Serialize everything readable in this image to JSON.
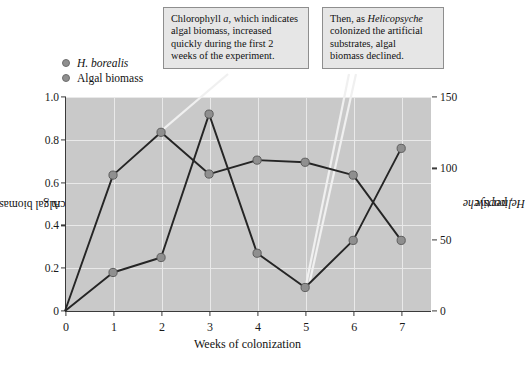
{
  "chart_data": {
    "type": "line",
    "title": "",
    "xlabel": "Weeks of colonization",
    "ylabel_left": "Algal biomass, as chlorophyll a (µg/cm2)",
    "ylabel_right": "Helicopsyche, per tile",
    "x": [
      0,
      1,
      2,
      3,
      4,
      5,
      6,
      7
    ],
    "xlim": [
      0,
      7.6
    ],
    "xticks": [
      "0",
      "1",
      "2",
      "3",
      "4",
      "5",
      "6",
      "7"
    ],
    "left_axis": {
      "ticks": [
        "0",
        "0.2",
        "0.4",
        "0.6",
        "0.8",
        "1.0"
      ],
      "tickvalues": [
        0,
        0.2,
        0.4,
        0.6,
        0.8,
        1.0
      ],
      "ylim": [
        0,
        1.0
      ]
    },
    "right_axis": {
      "ticks": [
        "0",
        "50",
        "100",
        "150"
      ],
      "tickvalues": [
        0,
        50,
        100,
        150
      ],
      "ylim": [
        0,
        150
      ]
    },
    "grid": true,
    "legend_position": "above-plot-left",
    "series": [
      {
        "name": "H. borealis",
        "axis": "right",
        "unit": "per tile",
        "color": "#8f8f8f",
        "values": [
          0,
          27,
          38,
          139,
          40,
          17,
          49,
          114
        ],
        "plot_values_left_scale": [
          0.0,
          0.18,
          0.25,
          0.92,
          0.27,
          0.11,
          0.33,
          0.76
        ]
      },
      {
        "name": "Algal biomass",
        "axis": "left",
        "unit": "µg/cm2",
        "color": "#8f8f8f",
        "values": [
          0.0,
          0.635,
          0.835,
          0.64,
          0.705,
          0.695,
          0.635,
          0.33
        ]
      }
    ],
    "annotations": [
      {
        "id": "callout-1",
        "text": "Chlorophyll a, which indicates algal biomass, increased quickly during the first 2 weeks of the experiment.",
        "target_x": 2,
        "target_y": 0.835
      },
      {
        "id": "callout-2",
        "text": "Then, as Helicopsyche colonized the artificial substrates, algal biomass declined.",
        "target_x": 5,
        "target_y": 0.11
      }
    ]
  },
  "legend": {
    "items": [
      {
        "label": "H. borealis",
        "italic": true,
        "color": "#8f8f8f"
      },
      {
        "label": "Algal biomass",
        "italic": false,
        "color": "#8f8f8f"
      }
    ]
  },
  "callouts": {
    "first": {
      "line1_a": "Chlorophyll ",
      "line1_ital": "a",
      "line1_b": ", which indicates",
      "line2": "algal biomass, increased",
      "line3": "quickly during the first 2",
      "line4": "weeks of the experiment."
    },
    "second": {
      "line1_a": "Then, as ",
      "line1_ital": "Helicopsyche",
      "line2": "colonized the artificial",
      "line3": "substrates, algal",
      "line4": "biomass declined."
    }
  },
  "axes": {
    "x_title": "Weeks of colonization",
    "y_left_pre": "Algal biomass, as chlorophyll ",
    "y_left_ital": "a",
    "y_left_post": " (µg/cm",
    "y_left_sup": "2",
    "y_left_end": ")",
    "y_right_ital": "Helicopsyche",
    "y_right_post": ", per tile"
  },
  "style": {
    "plot_background": "#c9c9c9",
    "grid_color": "#e9e9e9",
    "axis_color": "#3a3a3a",
    "line_color": "#252525",
    "marker_color": "#8f8f8f",
    "callout_background": "#e6e6e6",
    "callout_border": "#8e8e8e",
    "leader_color": "#f0f0f0"
  }
}
